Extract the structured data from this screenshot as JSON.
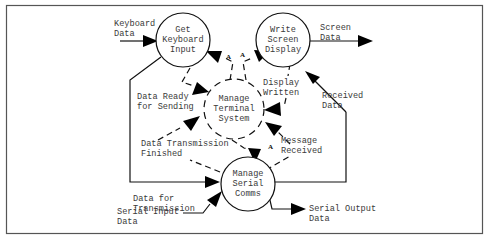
{
  "diagram": {
    "type": "data-flow-diagram",
    "processes": [
      {
        "id": "get_keyboard_input",
        "lines": [
          "Get",
          "Keyboard",
          "Input"
        ],
        "style": "solid"
      },
      {
        "id": "write_screen_display",
        "lines": [
          "Write",
          "Screen",
          "Display"
        ],
        "style": "solid"
      },
      {
        "id": "manage_terminal_system",
        "lines": [
          "Manage",
          "Terminal",
          "System"
        ],
        "style": "dashed"
      },
      {
        "id": "manage_serial_comms",
        "lines": [
          "Manage",
          "Serial",
          "Comms"
        ],
        "style": "solid"
      }
    ],
    "data_flows": [
      {
        "id": "keyboard_data",
        "lines": [
          "Keyboard",
          "Data"
        ],
        "style": "solid"
      },
      {
        "id": "screen_data",
        "lines": [
          "Screen",
          "Data"
        ],
        "style": "solid"
      },
      {
        "id": "received_data",
        "lines": [
          "Received",
          "Data"
        ],
        "style": "solid"
      },
      {
        "id": "data_for_transmission",
        "lines": [
          "Data for",
          "Transmission"
        ],
        "style": "solid"
      },
      {
        "id": "serial_input_data",
        "lines": [
          "Serial Input",
          "Data"
        ],
        "style": "solid"
      },
      {
        "id": "serial_output_data",
        "lines": [
          "Serial Output",
          "Data"
        ],
        "style": "solid"
      }
    ],
    "control_flows": [
      {
        "id": "data_ready_for_sending",
        "lines": [
          "Data Ready",
          "for Sending"
        ],
        "style": "dashed"
      },
      {
        "id": "display_written",
        "lines": [
          "Display",
          "Written"
        ],
        "style": "dashed"
      },
      {
        "id": "data_transmission_finished",
        "lines": [
          "Data Transmission",
          "Finished"
        ],
        "style": "dashed"
      },
      {
        "id": "message_received",
        "lines": [
          "Message",
          "Received"
        ],
        "style": "dashed"
      }
    ],
    "activators": [
      "A",
      "A",
      "A"
    ]
  }
}
